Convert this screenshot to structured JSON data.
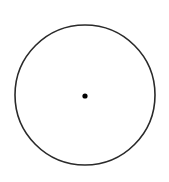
{
  "diagram": {
    "type": "geometric-figure",
    "canvas": {
      "width": 169,
      "height": 182,
      "background": "#ffffff"
    },
    "circle": {
      "cx": 85,
      "cy": 95,
      "r": 70,
      "stroke": "#2a2a2a",
      "stroke_width": 1.6,
      "fill": "none"
    },
    "center_point": {
      "cx": 85,
      "cy": 96,
      "r": 2.6,
      "fill": "#000000"
    }
  }
}
